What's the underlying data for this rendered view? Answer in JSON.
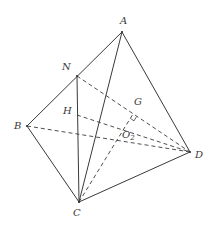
{
  "diagram": {
    "type": "tetrahedron-geometry",
    "line_color": "#3a3a3a",
    "background": "#ffffff",
    "points": {
      "A": {
        "label": "A",
        "x": 122,
        "y": 32
      },
      "N": {
        "label": "N",
        "x": 77,
        "y": 76
      },
      "B": {
        "label": "B",
        "x": 27,
        "y": 126
      },
      "C": {
        "label": "C",
        "x": 79,
        "y": 202
      },
      "D": {
        "label": "D",
        "x": 190,
        "y": 152
      },
      "H": {
        "label": "H",
        "x": 77,
        "y": 115
      },
      "G": {
        "label": "G",
        "x": 133,
        "y": 114
      },
      "O2": {
        "label": "O",
        "subscript": "2",
        "x": 124,
        "y": 130
      }
    },
    "solid_edges": [
      [
        "A",
        "B"
      ],
      [
        "A",
        "C"
      ],
      [
        "A",
        "D"
      ],
      [
        "B",
        "C"
      ],
      [
        "C",
        "D"
      ],
      [
        "N",
        "C"
      ]
    ],
    "dashed_edges": [
      [
        "N",
        "D"
      ],
      [
        "H",
        "D"
      ],
      [
        "B",
        "D"
      ],
      [
        "C",
        "G"
      ]
    ],
    "right_angle_marks": [
      "G"
    ]
  }
}
